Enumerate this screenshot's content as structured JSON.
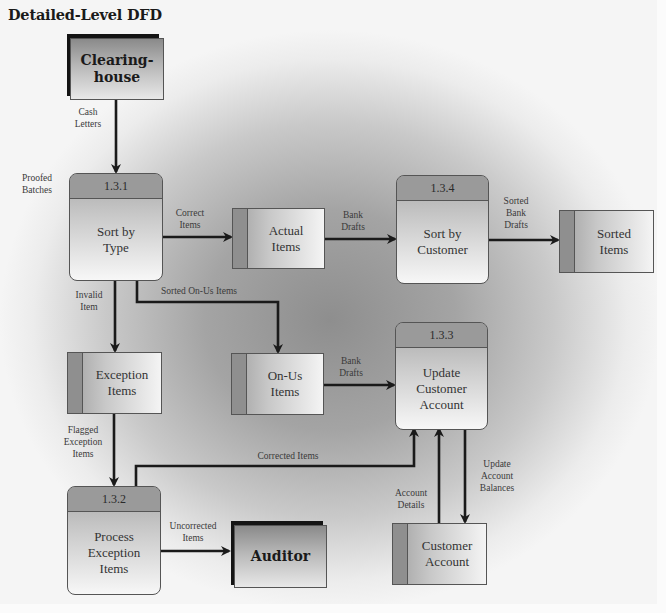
{
  "title": "Detailed-Level DFD",
  "colors": {
    "background_outer": "#f5f5f5",
    "background_center": "#8e8e8e",
    "arrow": "#1a1a1a",
    "process_header": "#9a9a9a",
    "store_tab": "#8f8f8f",
    "entity_shadow": "#141414"
  },
  "external_entities": [
    {
      "id": "clearinghouse",
      "label": "Clearing-\nhouse"
    },
    {
      "id": "auditor",
      "label": "Auditor"
    }
  ],
  "processes": [
    {
      "id": "1.3.1",
      "number": "1.3.1",
      "label": "Sort by\nType"
    },
    {
      "id": "1.3.4",
      "number": "1.3.4",
      "label": "Sort by\nCustomer"
    },
    {
      "id": "1.3.3",
      "number": "1.3.3",
      "label": "Update\nCustomer\nAccount"
    },
    {
      "id": "1.3.2",
      "number": "1.3.2",
      "label": "Process\nException\nItems"
    }
  ],
  "data_stores": [
    {
      "id": "actual-items",
      "label": "Actual\nItems"
    },
    {
      "id": "sorted-items",
      "label": "Sorted\nItems"
    },
    {
      "id": "exception-items",
      "label": "Exception\nItems"
    },
    {
      "id": "on-us-items",
      "label": "On-Us\nItems"
    },
    {
      "id": "customer-account",
      "label": "Customer\nAccount"
    }
  ],
  "flows": [
    {
      "from": "clearinghouse",
      "to": "1.3.1",
      "label": "Cash\nLetters"
    },
    {
      "from": "1.3.1",
      "to": "actual-items",
      "label": "Correct\nItems"
    },
    {
      "from": "actual-items",
      "to": "1.3.4",
      "label": "Bank\nDrafts"
    },
    {
      "from": "1.3.4",
      "to": "sorted-items",
      "label": "Sorted\nBank\nDrafts"
    },
    {
      "from": "1.3.1",
      "to": "exception-items",
      "label": "Invalid\nItem"
    },
    {
      "from": "1.3.1",
      "to": "on-us-items",
      "label": "Sorted On-Us Items"
    },
    {
      "from": "on-us-items",
      "to": "1.3.3",
      "label": "Bank\nDrafts"
    },
    {
      "from": "exception-items",
      "to": "1.3.2",
      "label": "Flagged\nException\nItems"
    },
    {
      "from": "1.3.2",
      "to": "1.3.3",
      "label": "Corrected Items"
    },
    {
      "from": "1.3.2",
      "to": "auditor",
      "label": "Uncorrected\nItems"
    },
    {
      "from": "customer-account",
      "to": "1.3.3",
      "label": "Account\nDetails"
    },
    {
      "from": "1.3.3",
      "to": "customer-account",
      "label": "Update\nAccount\nBalances"
    }
  ],
  "side_labels": {
    "proofed_batches": "Proofed\nBatches"
  }
}
